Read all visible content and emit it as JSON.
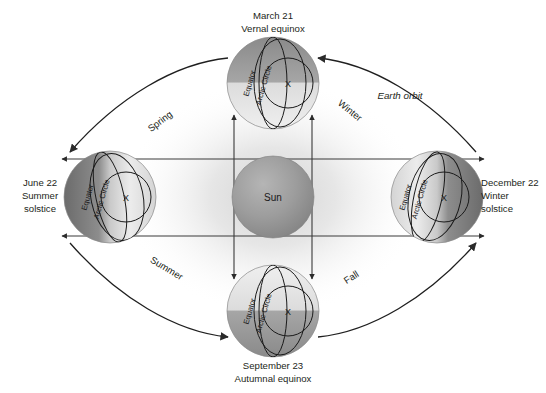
{
  "diagram": {
    "title_subject": "Earth orbit and seasons",
    "center_body": {
      "label": "Sun",
      "color": "#8e8e8e"
    },
    "orbit_label": "Earth orbit",
    "positions": [
      {
        "id": "march",
        "date": "March 21",
        "event": "Vernal equinox",
        "globe_labels": {
          "equator": "Equator",
          "arctic": "Arctic Circle",
          "mark": "X"
        }
      },
      {
        "id": "june",
        "date": "June 22",
        "event_line1": "Summer",
        "event_line2": "solstice",
        "globe_labels": {
          "equator": "Equator",
          "arctic": "Arctic Circle",
          "mark": "X"
        }
      },
      {
        "id": "september",
        "date": "September 23",
        "event": "Autumnal equinox",
        "globe_labels": {
          "equator": "Equator",
          "arctic": "Arctic Circle",
          "mark": "X"
        }
      },
      {
        "id": "december",
        "date": "December 22",
        "event_line1": "Winter",
        "event_line2": "solstice",
        "globe_labels": {
          "equator": "Equator",
          "arctic": "Arctic Circle",
          "mark": "X"
        }
      }
    ],
    "seasons": [
      {
        "id": "spring",
        "label": "Spring"
      },
      {
        "id": "summer",
        "label": "Summer"
      },
      {
        "id": "fall",
        "label": "Fall"
      },
      {
        "id": "winter",
        "label": "Winter"
      }
    ],
    "colors": {
      "ink": "#231f20",
      "line": "#3a3a3a",
      "sun_core": "#9a9a9a",
      "globe_light": "#e6e6e6",
      "globe_dark": "#6e6e6e",
      "background": "#ffffff"
    }
  }
}
